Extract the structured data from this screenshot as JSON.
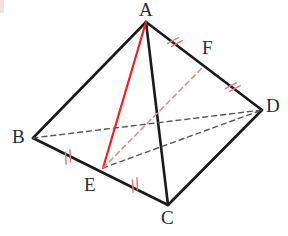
{
  "figure": {
    "width": 288,
    "height": 236,
    "background_color": "#ffffff"
  },
  "colors": {
    "edge_solid": "#1a1a1a",
    "edge_hidden_dashed": "#555555",
    "highlight_red": "#ee2222",
    "highlight_red_dashed": "#e98b8b",
    "tick_red": "#e87b7b",
    "label_text": "#2b2b2b"
  },
  "labels": [
    {
      "name": "A",
      "text": "A",
      "x": 139,
      "y": 0
    },
    {
      "name": "B",
      "text": "B",
      "x": 12,
      "y": 127
    },
    {
      "name": "C",
      "text": "C",
      "x": 161,
      "y": 208
    },
    {
      "name": "D",
      "text": "D",
      "x": 266,
      "y": 96
    },
    {
      "name": "E",
      "text": "E",
      "x": 84,
      "y": 175
    },
    {
      "name": "F",
      "text": "F",
      "x": 202,
      "y": 38
    }
  ],
  "points": {
    "A": {
      "x": 146,
      "y": 22
    },
    "B": {
      "x": 33,
      "y": 138
    },
    "C": {
      "x": 168,
      "y": 205
    },
    "D": {
      "x": 262,
      "y": 110
    },
    "E": {
      "x": 103,
      "y": 168
    },
    "F": {
      "x": 204,
      "y": 66
    }
  },
  "edges": [
    {
      "name": "edge-AB",
      "from": "A",
      "to": "B",
      "style": "solid",
      "color": "#1a1a1a",
      "width": 2.6
    },
    {
      "name": "edge-AC",
      "from": "A",
      "to": "C",
      "style": "solid",
      "color": "#1a1a1a",
      "width": 2.6
    },
    {
      "name": "edge-AD",
      "from": "A",
      "to": "D",
      "style": "solid",
      "color": "#1a1a1a",
      "width": 2.6
    },
    {
      "name": "edge-BC",
      "from": "B",
      "to": "C",
      "style": "solid",
      "color": "#1a1a1a",
      "width": 2.6
    },
    {
      "name": "edge-CD",
      "from": "C",
      "to": "D",
      "style": "solid",
      "color": "#1a1a1a",
      "width": 2.6
    },
    {
      "name": "edge-BD",
      "from": "B",
      "to": "D",
      "style": "dashed",
      "color": "#555555",
      "width": 1.4
    },
    {
      "name": "edge-ED",
      "from": "E",
      "to": "D",
      "style": "dashed",
      "color": "#555555",
      "width": 1.4
    },
    {
      "name": "segment-AE",
      "from": "A",
      "to": "E",
      "style": "solid",
      "color": "#ee2222",
      "width": 2.2
    },
    {
      "name": "segment-EF",
      "from": "E",
      "to": "F",
      "style": "dashed",
      "color": "#e98b8b",
      "width": 1.6
    }
  ],
  "tick_marks": [
    {
      "name": "tick-BE",
      "on_segment": "BE",
      "x": 68,
      "y": 157,
      "angle": -27,
      "count": 2
    },
    {
      "name": "tick-EC",
      "on_segment": "EC",
      "x": 135,
      "y": 185,
      "angle": -27,
      "count": 2
    },
    {
      "name": "tick-AF",
      "on_segment": "AF",
      "x": 175,
      "y": 42,
      "angle": 37,
      "count": 2
    },
    {
      "name": "tick-FD",
      "on_segment": "FD",
      "x": 233,
      "y": 87,
      "angle": 37,
      "count": 2
    }
  ]
}
